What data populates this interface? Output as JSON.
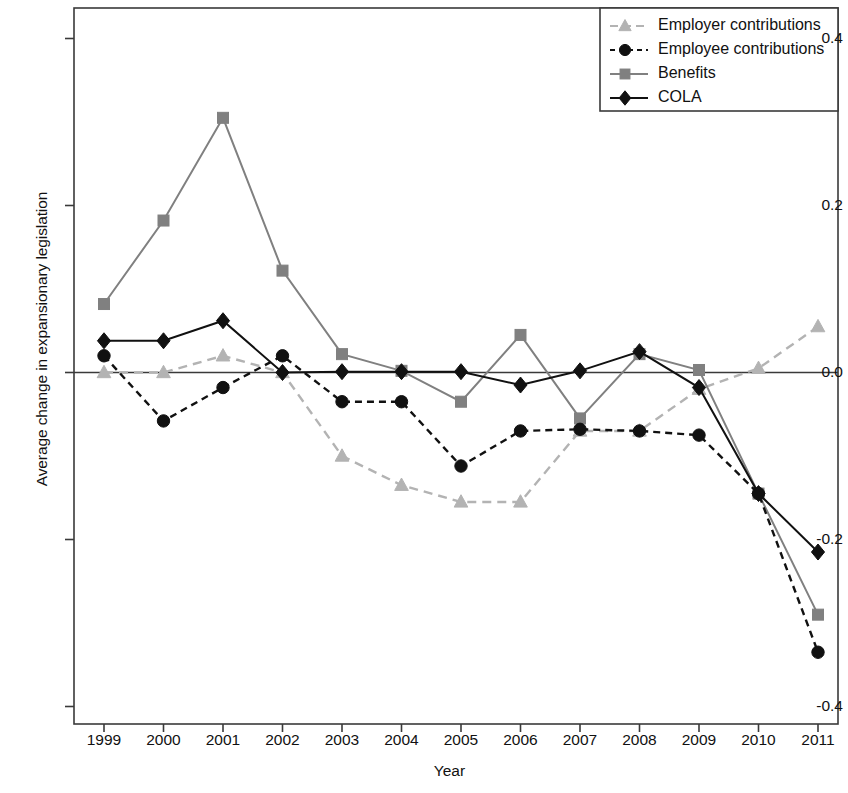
{
  "chart_data": {
    "type": "line",
    "title": "",
    "xlabel": "Year",
    "ylabel": "Average change in expansionary legislation",
    "categories": [
      "1999",
      "2000",
      "2001",
      "2002",
      "2003",
      "2004",
      "2005",
      "2006",
      "2007",
      "2008",
      "2009",
      "2010",
      "2011"
    ],
    "x": [
      1999,
      2000,
      2001,
      2002,
      2003,
      2004,
      2005,
      2006,
      2007,
      2008,
      2009,
      2010,
      2011
    ],
    "ylim": [
      -0.4,
      0.4
    ],
    "yticks": [
      "0.4",
      "0.2",
      "0.0",
      "-0.2",
      "-0.4"
    ],
    "ytick_values": [
      0.4,
      0.2,
      0.0,
      -0.2,
      -0.4
    ],
    "grid": false,
    "legend_position": "top-right",
    "zero_line": 0.0,
    "series": [
      {
        "name": "Employer contributions",
        "color": "#b3b3b3",
        "marker": "triangle",
        "linestyle": "dashed",
        "values": [
          0.0,
          0.0,
          0.02,
          0.0,
          -0.1,
          -0.135,
          -0.155,
          -0.155,
          -0.07,
          -0.07,
          -0.02,
          0.005,
          0.055
        ]
      },
      {
        "name": "Employee contributions",
        "color": "#111111",
        "marker": "circle",
        "linestyle": "dashed",
        "values": [
          0.02,
          -0.058,
          -0.018,
          0.02,
          -0.035,
          -0.035,
          -0.112,
          -0.07,
          -0.068,
          -0.07,
          -0.075,
          -0.145,
          -0.335
        ]
      },
      {
        "name": "Benefits",
        "color": "#808080",
        "marker": "square",
        "linestyle": "solid",
        "values": [
          0.082,
          0.182,
          0.305,
          0.122,
          0.022,
          0.002,
          -0.035,
          0.045,
          -0.055,
          0.022,
          0.003,
          -0.145,
          -0.29
        ]
      },
      {
        "name": "COLA",
        "color": "#111111",
        "marker": "diamond",
        "linestyle": "solid",
        "values": [
          0.038,
          0.038,
          0.062,
          0.0,
          0.001,
          0.001,
          0.001,
          -0.015,
          0.002,
          0.025,
          -0.018,
          -0.145,
          -0.215
        ]
      }
    ]
  }
}
